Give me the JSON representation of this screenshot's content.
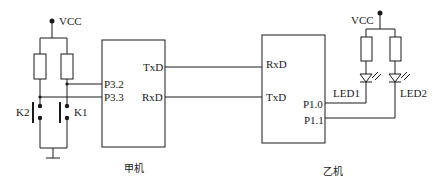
{
  "diagram": {
    "type": "circuit-schematic",
    "left_mcu": {
      "caption": "甲机",
      "pins": {
        "txd": "TxD",
        "rxd": "RxD",
        "p32": "P3.2",
        "p33": "P3.3"
      },
      "vcc": "VCC",
      "switches": {
        "k1": "K1",
        "k2": "K2"
      }
    },
    "right_mcu": {
      "caption": "乙机",
      "pins": {
        "rxd": "RxD",
        "txd": "TxD",
        "p10": "P1.0",
        "p11": "P1.1"
      },
      "vcc": "VCC",
      "leds": {
        "led1": "LED1",
        "led2": "LED2"
      }
    },
    "connections": [
      {
        "from": "甲机.TxD",
        "to": "乙机.RxD"
      },
      {
        "from": "甲机.RxD",
        "to": "乙机.TxD"
      },
      {
        "from": "K1",
        "to": "甲机.P3.2"
      },
      {
        "from": "K2",
        "to": "甲机.P3.3"
      },
      {
        "from": "乙机.P1.0",
        "to": "LED1"
      },
      {
        "from": "乙机.P1.1",
        "to": "LED2"
      }
    ]
  }
}
